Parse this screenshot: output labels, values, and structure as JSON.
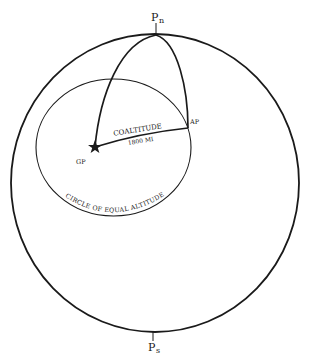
{
  "diagram": {
    "type": "celestial-sphere-navigation",
    "labels": {
      "north_pole": "P",
      "north_pole_sub": "n",
      "south_pole": "P",
      "south_pole_sub": "s",
      "geographic_position": "GP",
      "assumed_position": "AP",
      "coaltitude": "COALTITUDE",
      "distance": "1800 MI",
      "circle": "CIRCLE OF EQUAL ALTITUDE"
    },
    "colors": {
      "stroke": "#1a1a1a",
      "background": "#ffffff"
    }
  }
}
